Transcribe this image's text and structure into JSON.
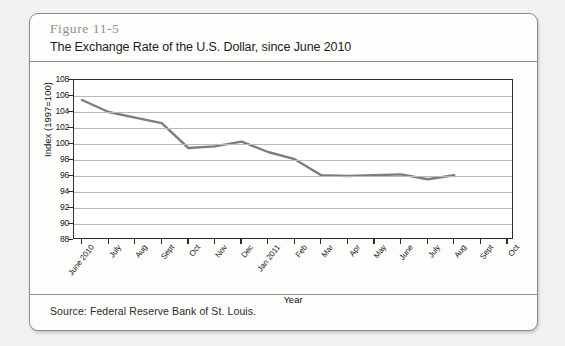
{
  "figure": {
    "number": "Figure 11-5",
    "title": "The Exchange Rate of the U.S. Dollar, since June 2010",
    "source": "Source: Federal Reserve Bank of St. Louis."
  },
  "chart_data": {
    "type": "line",
    "title": "The Exchange Rate of the U.S. Dollar, since June 2010",
    "xlabel": "Year",
    "ylabel": "Index (1997=100)",
    "ylim": [
      88,
      108
    ],
    "ytick_step": 2,
    "yticks": [
      108,
      106,
      104,
      102,
      100,
      98,
      96,
      94,
      92,
      90,
      88
    ],
    "grid": true,
    "legend": "none",
    "line_color": "#7d7d7d",
    "categories": [
      "June 2010",
      "July",
      "Aug",
      "Sept",
      "Oct",
      "Nov",
      "Dec",
      "Jan 2011",
      "Feb",
      "Mar",
      "Apr",
      "May",
      "June",
      "July",
      "Aug",
      "Sept",
      "Oct"
    ],
    "series": [
      {
        "name": "U.S. Dollar Index (1997=100)",
        "values": [
          105.5,
          104.0,
          103.3,
          102.6,
          99.5,
          99.7,
          100.3,
          99.0,
          98.1,
          96.1,
          96.0,
          96.1,
          96.2,
          95.6,
          96.1,
          null,
          null
        ]
      }
    ]
  }
}
